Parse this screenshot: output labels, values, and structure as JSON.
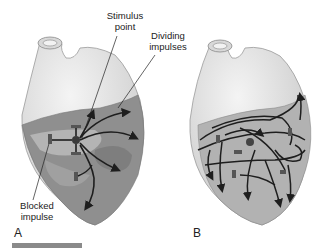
{
  "labels": {
    "stimulus_point": [
      "Stimulus",
      "point"
    ],
    "dividing_impulses": [
      "Dividing",
      "impulses"
    ],
    "blocked_impulse": [
      "Blocked",
      "impulse"
    ]
  },
  "panels": {
    "a": "A",
    "b": "B"
  },
  "colors": {
    "heart_light": "#e6e6e6",
    "heart_dark": "#8c8c8c",
    "myocardium_mid": "#a8a8a8",
    "arrow": "#1e1e1e",
    "block": "#555555"
  }
}
